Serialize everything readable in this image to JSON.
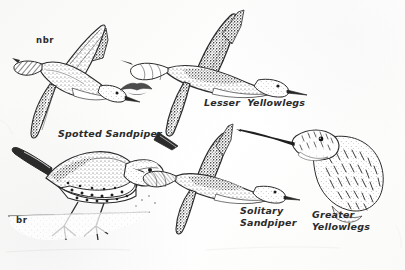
{
  "plate": {
    "kind": "field-guide-illustration-plate",
    "medium": "pen-and-ink stipple drawing",
    "background_color": "#fdfdfc",
    "ink_color": "#2b2b2b",
    "width": 405,
    "height": 270
  },
  "labels": {
    "nonbreeding_code": "nbr",
    "breeding_code": "br",
    "spotted_sandpiper": "Spotted Sandpiper",
    "lesser_yellowlegs": "Lesser  Yellowlegs",
    "solitary_sandpiper_line1": "Solitary",
    "solitary_sandpiper_line2": "Sandpiper",
    "greater_yellowlegs_line1": "Greater",
    "greater_yellowlegs_line2": "Yellowlegs"
  },
  "figures": [
    {
      "id": "spotted-sandpiper-flight",
      "name": "Spotted Sandpiper in flight",
      "plumage": "nonbreeding",
      "pose": "flying, banking left, wings raised",
      "region": [
        20,
        25,
        120,
        115
      ]
    },
    {
      "id": "lesser-yellowlegs-flight",
      "name": "Lesser Yellowlegs in flight",
      "pose": "flying right, wings raised, long bill",
      "region": [
        140,
        15,
        150,
        90
      ]
    },
    {
      "id": "distant-bird-sketch",
      "name": "small distant flying bird sketch",
      "pose": "tiny silhouette, wings spread",
      "region": [
        118,
        78,
        42,
        28
      ]
    },
    {
      "id": "spotted-sandpiper-standing",
      "name": "Spotted Sandpiper standing on shoreline",
      "plumage": "breeding",
      "pose": "standing, spotted underparts, teetering",
      "region": [
        5,
        145,
        145,
        105
      ]
    },
    {
      "id": "solitary-sandpiper-flight",
      "name": "Solitary Sandpiper in flight",
      "pose": "flying right, dark wings raised",
      "region": [
        150,
        135,
        130,
        85
      ]
    },
    {
      "id": "greater-yellowlegs-head",
      "name": "Greater Yellowlegs head and neck detail",
      "pose": "head profile facing left, very long slightly upturned bill",
      "region": [
        275,
        118,
        125,
        90
      ]
    }
  ]
}
